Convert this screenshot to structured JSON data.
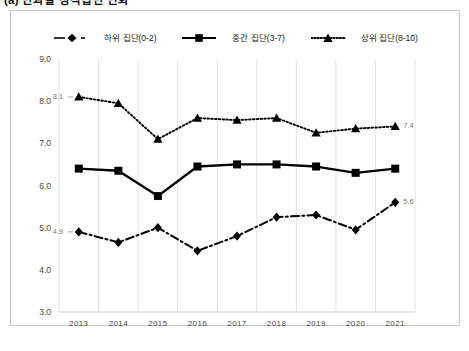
{
  "caption": "(a) 단과별 성적집단 변화",
  "legend": {
    "position": "top-center",
    "items": [
      {
        "label": "하위 집단(0-2)",
        "marker": "diamond-marker-icon",
        "line_style": "dash-dot",
        "color": "#000000"
      },
      {
        "label": "중간 집단(3-7)",
        "marker": "square-marker-icon",
        "line_style": "solid",
        "color": "#000000"
      },
      {
        "label": "상위 집단(8-10)",
        "marker": "triangle-marker-icon",
        "line_style": "dotted",
        "color": "#000000"
      }
    ]
  },
  "axes": {
    "y_ticks": [
      "9.0",
      "8.0",
      "7.0",
      "6.0",
      "5.0",
      "4.0",
      "3.0"
    ],
    "x_ticks": [
      "2013",
      "2014",
      "2015",
      "2016",
      "2017",
      "2018",
      "2019",
      "2020",
      "2021"
    ]
  },
  "annotations": [
    {
      "name": "label-top-start",
      "text": "8.1"
    },
    {
      "name": "label-top-end",
      "text": "7.4"
    },
    {
      "name": "label-bottom-start",
      "text": "4.9"
    },
    {
      "name": "label-bottom-end",
      "text": "5.6"
    }
  ],
  "chart_data": {
    "type": "line",
    "title": "(a) 단과별 성적집단 변화",
    "xlabel": "",
    "ylabel": "",
    "ylim": [
      3.0,
      9.0
    ],
    "ytick_step": 1.0,
    "grid": "vertical",
    "legend_position": "top-center",
    "categories": [
      "2013",
      "2014",
      "2015",
      "2016",
      "2017",
      "2018",
      "2019",
      "2020",
      "2021"
    ],
    "series": [
      {
        "name": "하위 집단(0-2)",
        "line_style": "dash-dot",
        "marker": "diamond",
        "color": "#000000",
        "values": [
          4.9,
          4.65,
          5.0,
          4.45,
          4.8,
          5.25,
          5.3,
          4.95,
          5.6
        ],
        "labeled_points": {
          "2013": "4.9",
          "2021": "5.6"
        }
      },
      {
        "name": "중간 집단(3-7)",
        "line_style": "solid",
        "marker": "square",
        "color": "#000000",
        "values": [
          6.4,
          6.35,
          5.75,
          6.45,
          6.5,
          6.5,
          6.45,
          6.3,
          6.4
        ],
        "labeled_points": {}
      },
      {
        "name": "상위 집단(8-10)",
        "line_style": "dotted",
        "marker": "triangle",
        "color": "#000000",
        "values": [
          8.1,
          7.95,
          7.1,
          7.6,
          7.55,
          7.6,
          7.25,
          7.35,
          7.4
        ],
        "labeled_points": {
          "2013": "8.1",
          "2021": "7.4"
        }
      }
    ]
  }
}
